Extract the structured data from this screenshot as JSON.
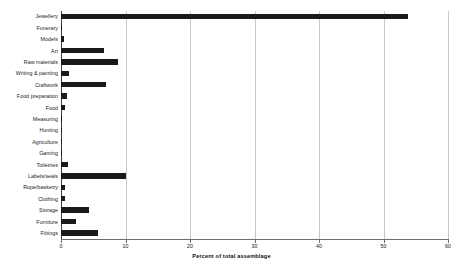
{
  "chart_data": {
    "type": "bar",
    "orientation": "horizontal",
    "title": "",
    "xlabel": "Percent of total assemblage",
    "ylabel": "",
    "xlim": [
      0,
      60
    ],
    "ylim": null,
    "xticks": [
      0,
      10,
      20,
      30,
      40,
      50,
      60
    ],
    "xtick_labels": [
      "0",
      "10",
      "20",
      "30",
      "40",
      "50",
      "60"
    ],
    "grid": "vertical",
    "legend": null,
    "bar_color": "#1a1a1a",
    "categories": [
      "Jewellery",
      "Funerary",
      "Models",
      "Art",
      "Raw materials",
      "Writing & painting",
      "Craftwork",
      "Food preparation",
      "Food",
      "Measuring",
      "Hunting",
      "Agriculture",
      "Gaming",
      "Toiletries",
      "Labels/seals",
      "Rope/basketry",
      "Clothing",
      "Storage",
      "Furniture",
      "Fittings"
    ],
    "values": [
      53.8,
      0.1,
      0.5,
      6.7,
      8.8,
      1.2,
      7.0,
      0.9,
      0.6,
      0.1,
      0.1,
      0.1,
      0.1,
      1.1,
      10.1,
      0.6,
      0.6,
      4.3,
      2.3,
      5.7
    ]
  }
}
